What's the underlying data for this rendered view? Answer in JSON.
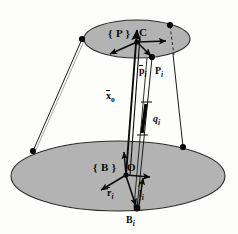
{
  "figure": {
    "kind": "stewart-platform-kinematics-diagram",
    "background_color": "#fdfdfb",
    "ink_color": "#0a0a0a",
    "platform_fill": "#b3b3b3",
    "platform_stroke": "#2b2b2b"
  },
  "labels": {
    "moving_frame": "{ P }",
    "moving_center": "C",
    "platform_vector": "p",
    "platform_vector_sub": "i",
    "platform_point": "P",
    "platform_point_sub": "i",
    "position_vector": "x",
    "position_vector_sub": "o",
    "leg_length": "q",
    "leg_length_sub": "i",
    "base_frame": "{ B }",
    "base_origin": "O",
    "base_vector": "r",
    "base_vector_sub": "i",
    "unit_vector": "l",
    "unit_vector_sub": "i",
    "base_point": "B",
    "base_point_sub": "i"
  },
  "geometry": {
    "top_platform": {
      "cx": 137,
      "cy": 39,
      "rx": 53,
      "ry": 19
    },
    "bottom_platform": {
      "cx": 118,
      "cy": 176,
      "rx": 107,
      "ry": 35
    },
    "top_joints": [
      {
        "name": "top-joint-left",
        "x": 82,
        "y": 39
      },
      {
        "name": "top-joint-right-rear",
        "x": 170,
        "y": 25
      },
      {
        "name": "top-joint-pi",
        "x": 152,
        "y": 57
      }
    ],
    "bottom_joints": [
      {
        "name": "bottom-joint-left",
        "x": 33,
        "y": 151
      },
      {
        "name": "bottom-joint-right",
        "x": 183,
        "y": 147
      },
      {
        "name": "bottom-joint-bi",
        "x": 137,
        "y": 208
      }
    ],
    "moving_center_point": {
      "x": 137,
      "y": 42
    },
    "base_origin_point": {
      "x": 126,
      "y": 175
    },
    "actuator_segment": {
      "x1": 146,
      "y1": 104,
      "x2": 142,
      "y2": 133
    }
  },
  "elements": [
    {
      "name": "top-platform-ellipse",
      "role": "moving platform {P}"
    },
    {
      "name": "bottom-platform-ellipse",
      "role": "fixed base {B}"
    },
    {
      "name": "strut-left",
      "role": "leg from top-left joint to bottom-left joint"
    },
    {
      "name": "strut-right",
      "role": "leg from top-rear joint to bottom-right joint"
    },
    {
      "name": "strut-i",
      "role": "leg i from Pi to Bi"
    },
    {
      "name": "vector-xo",
      "role": "position vector from O to C"
    },
    {
      "name": "vector-pi",
      "role": "vector from C to Pi"
    },
    {
      "name": "vector-ri",
      "role": "vector from O to Bi"
    },
    {
      "name": "unit-vector-li",
      "role": "unit vector along leg i"
    },
    {
      "name": "actuator-qi",
      "role": "prismatic joint length qi"
    }
  ]
}
